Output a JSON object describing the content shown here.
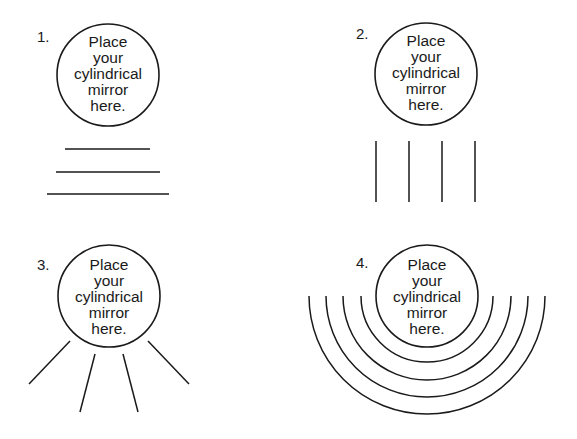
{
  "panels": [
    {
      "number": "1.",
      "circle_text": [
        "Place",
        "your",
        "cylindrical",
        "mirror",
        "here."
      ],
      "pattern": "horizontal-lines",
      "circle": {
        "cx": 108,
        "cy": 75,
        "r": 51
      },
      "lines": [
        [
          65,
          149,
          150,
          149
        ],
        [
          56,
          172,
          160,
          172
        ],
        [
          47,
          194,
          169,
          194
        ]
      ]
    },
    {
      "number": "2.",
      "circle_text": [
        "Place",
        "your",
        "cylindrical",
        "mirror",
        "here."
      ],
      "pattern": "vertical-lines",
      "circle": {
        "cx": 426,
        "cy": 74,
        "r": 51
      },
      "lines": [
        [
          376,
          141,
          376,
          202
        ],
        [
          409,
          141,
          409,
          202
        ],
        [
          442,
          141,
          442,
          202
        ],
        [
          475,
          141,
          475,
          202
        ]
      ]
    },
    {
      "number": "3.",
      "circle_text": [
        "Place",
        "your",
        "cylindrical",
        "mirror",
        "here."
      ],
      "pattern": "radial-lines",
      "circle": {
        "cx": 109,
        "cy": 296,
        "r": 51
      },
      "lines": [
        [
          70,
          341,
          29,
          384
        ],
        [
          95,
          354,
          80,
          412
        ],
        [
          123,
          354,
          138,
          412
        ],
        [
          148,
          341,
          189,
          384
        ]
      ]
    },
    {
      "number": "4.",
      "circle_text": [
        "Place",
        "your",
        "cylindrical",
        "mirror",
        "here."
      ],
      "pattern": "concentric-arcs",
      "circle": {
        "cx": 427,
        "cy": 296,
        "r": 51
      },
      "arc_radii": [
        66,
        84,
        101,
        118
      ]
    }
  ],
  "colors": {
    "stroke": "#1a1a1a",
    "background": "#ffffff"
  }
}
